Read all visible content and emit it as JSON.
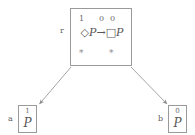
{
  "diagram": {
    "root": {
      "label": "r",
      "valuations": [
        "1",
        "0",
        "0"
      ],
      "formula": {
        "full": "◇P→□P",
        "diamond": "◇",
        "prop_left": "P",
        "implication": "→",
        "box": "□",
        "prop_right": "P"
      },
      "markers": [
        "*",
        "*"
      ]
    },
    "leaves": [
      {
        "label": "a",
        "valuation": "1",
        "formula": "P"
      },
      {
        "label": "b",
        "valuation": "0",
        "formula": "P"
      }
    ],
    "edges": [
      {
        "from": "r",
        "to": "a"
      },
      {
        "from": "r",
        "to": "b"
      }
    ],
    "colors": {
      "line": "#9a9a9a",
      "text": "#6a6a6a",
      "background": "#ffffff"
    }
  }
}
